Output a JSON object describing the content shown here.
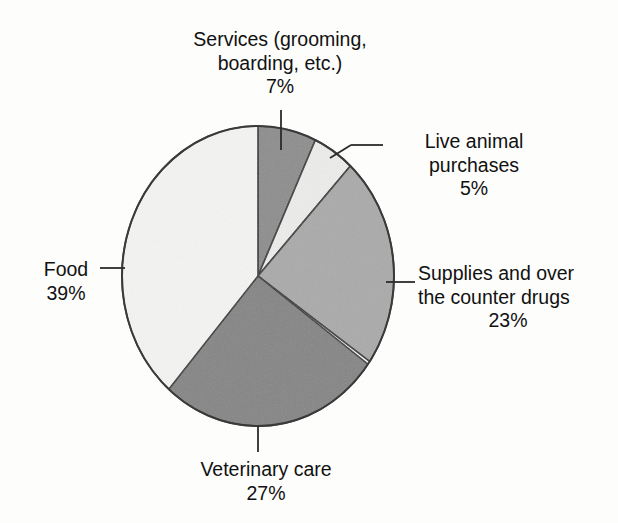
{
  "chart_data": {
    "type": "pie",
    "title": "",
    "subtitle": "",
    "xlabel": "",
    "ylabel": "",
    "legend_position": "none",
    "grid": false,
    "units": "percent",
    "total": 101,
    "start_angle_deg": 0,
    "direction": "clockwise",
    "categories": [
      "Services (grooming, boarding, etc.)",
      "Live animal purchases",
      "Supplies and over the counter drugs",
      "Veterinary care",
      "Food"
    ],
    "values": [
      7,
      5,
      23,
      27,
      39
    ],
    "slices": [
      {
        "id": "services",
        "label_line1": "Services (grooming,",
        "label_line2": "boarding, etc.)",
        "value": 7,
        "value_label": "7%",
        "color": "#8d8d8d"
      },
      {
        "id": "live-animal-purchases",
        "label_line1": "Live animal",
        "label_line2": "purchases",
        "value": 5,
        "value_label": "5%",
        "color": "#ececea"
      },
      {
        "id": "supplies-and-otc-drugs",
        "label_line1": "Supplies and over",
        "label_line2": "the counter drugs",
        "value": 23,
        "value_label": "23%",
        "color": "#aaaaaa"
      },
      {
        "id": "veterinary-care",
        "label_line1": "Veterinary care",
        "label_line2": "",
        "value": 27,
        "value_label": "27%",
        "color": "#858585"
      },
      {
        "id": "food",
        "label_line1": "Food",
        "label_line2": "",
        "value": 39,
        "value_label": "39%",
        "color": "#f4f4f2"
      }
    ],
    "outline_color": "#3a3a3a",
    "background_color": "#fdfdfc"
  },
  "artifacts": {
    "bleed_text_1": "pet are",
    "bleed_text_2": "an let o",
    "bleed_text_3": "tions"
  }
}
